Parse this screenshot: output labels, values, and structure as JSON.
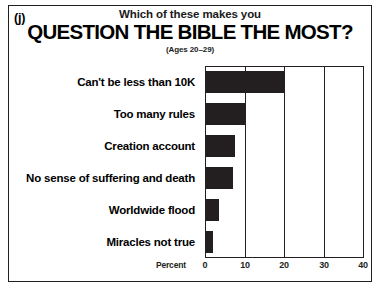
{
  "figure": {
    "panel_label": "(j)",
    "title_line1": "Which of these makes you",
    "title_line2": "QUESTION THE BIBLE THE MOST?",
    "subtitle": "(Ages 20–29)"
  },
  "chart_data": {
    "type": "bar",
    "orientation": "horizontal",
    "title": "Which of these makes you QUESTION THE BIBLE THE MOST?",
    "subtitle": "(Ages 20–29)",
    "categories": [
      "Can't be less than 10K",
      "Too many rules",
      "Creation account",
      "No sense of suffering and death",
      "Worldwide flood",
      "Miracles not true"
    ],
    "values": [
      20,
      10,
      7.5,
      7,
      3.5,
      2
    ],
    "xlabel": "Percent",
    "ylabel": "",
    "xlim": [
      0,
      40
    ],
    "xticks": [
      0,
      10,
      20,
      30,
      40
    ],
    "xtick_labels": [
      "0",
      "10",
      "20",
      "30",
      "40"
    ],
    "grid": true,
    "legend": false,
    "bar_color": "#231f20",
    "background_color": "#ffffff"
  }
}
